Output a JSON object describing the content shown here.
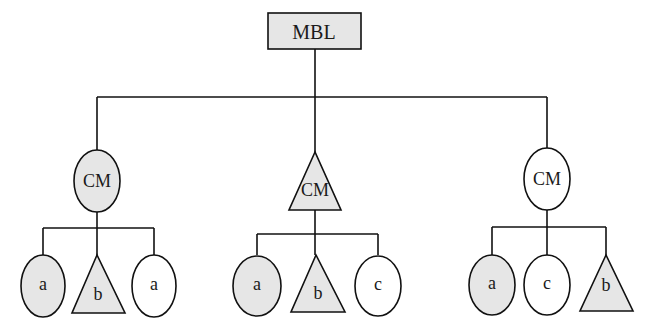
{
  "diagram": {
    "root": {
      "label": "MBL",
      "shape": "rectangle",
      "fill": "#e6e6e6"
    },
    "middle_nodes": [
      {
        "label": "CM",
        "shape": "ellipse",
        "fill": "#e6e6e6"
      },
      {
        "label": "CM",
        "shape": "triangle",
        "fill": "#e6e6e6"
      },
      {
        "label": "CM",
        "shape": "ellipse",
        "fill": "#ffffff"
      }
    ],
    "leaf_groups": [
      [
        {
          "label": "a",
          "shape": "ellipse",
          "fill": "#e6e6e6"
        },
        {
          "label": "b",
          "shape": "triangle",
          "fill": "#e6e6e6"
        },
        {
          "label": "a",
          "shape": "ellipse",
          "fill": "#ffffff"
        }
      ],
      [
        {
          "label": "a",
          "shape": "ellipse",
          "fill": "#e6e6e6"
        },
        {
          "label": "b",
          "shape": "triangle",
          "fill": "#e6e6e6"
        },
        {
          "label": "c",
          "shape": "ellipse",
          "fill": "#ffffff"
        }
      ],
      [
        {
          "label": "a",
          "shape": "ellipse",
          "fill": "#e6e6e6"
        },
        {
          "label": "c",
          "shape": "ellipse",
          "fill": "#ffffff"
        },
        {
          "label": "b",
          "shape": "triangle",
          "fill": "#e6e6e6"
        }
      ]
    ],
    "colors": {
      "shaded": "#e6e6e6",
      "unshaded": "#ffffff",
      "stroke": "#111111"
    }
  }
}
